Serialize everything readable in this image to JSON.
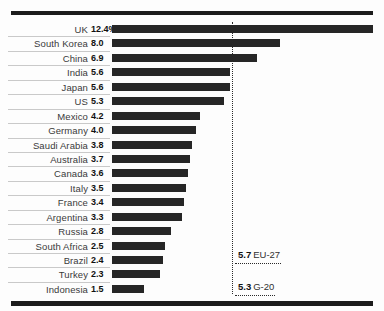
{
  "chart_data": {
    "type": "bar",
    "title": "",
    "subtitle": "",
    "xlabel": "",
    "ylabel": "",
    "orientation": "horizontal",
    "grid": false,
    "legend": "none",
    "value_suffix": "%",
    "xlim": [
      0,
      12.4
    ],
    "categories": [
      "UK",
      "South Korea",
      "China",
      "India",
      "Japan",
      "US",
      "Mexico",
      "Germany",
      "Saudi Arabia",
      "Australia",
      "Canada",
      "Italy",
      "France",
      "Argentina",
      "Russia",
      "South Africa",
      "Brazil",
      "Turkey",
      "Indonesia"
    ],
    "values": [
      12.4,
      8.0,
      6.9,
      5.6,
      5.6,
      5.3,
      4.2,
      4.0,
      3.8,
      3.7,
      3.6,
      3.5,
      3.4,
      3.3,
      2.8,
      2.5,
      2.4,
      2.3,
      1.5
    ],
    "value_labels": [
      "12.4%",
      "8.0",
      "6.9",
      "5.6",
      "5.6",
      "5.3",
      "4.2",
      "4.0",
      "3.8",
      "3.7",
      "3.6",
      "3.5",
      "3.4",
      "3.3",
      "2.8",
      "2.5",
      "2.4",
      "2.3",
      "1.5"
    ],
    "bar_color": "#262626",
    "reference_lines": [
      {
        "value": 5.7,
        "label": "EU-27",
        "value_text": "5.7"
      },
      {
        "value": 5.3,
        "label": "G-20",
        "value_text": "5.3"
      }
    ]
  },
  "rows": [
    {
      "label": "UK",
      "value_text": "12.4%"
    },
    {
      "label": "South Korea",
      "value_text": "8.0"
    },
    {
      "label": "China",
      "value_text": "6.9"
    },
    {
      "label": "India",
      "value_text": "5.6"
    },
    {
      "label": "Japan",
      "value_text": "5.6"
    },
    {
      "label": "US",
      "value_text": "5.3"
    },
    {
      "label": "Mexico",
      "value_text": "4.2"
    },
    {
      "label": "Germany",
      "value_text": "4.0"
    },
    {
      "label": "Saudi Arabia",
      "value_text": "3.8"
    },
    {
      "label": "Australia",
      "value_text": "3.7"
    },
    {
      "label": "Canada",
      "value_text": "3.6"
    },
    {
      "label": "Italy",
      "value_text": "3.5"
    },
    {
      "label": "France",
      "value_text": "3.4"
    },
    {
      "label": "Argentina",
      "value_text": "3.3"
    },
    {
      "label": "Russia",
      "value_text": "2.8"
    },
    {
      "label": "South Africa",
      "value_text": "2.5"
    },
    {
      "label": "Brazil",
      "value_text": "2.4"
    },
    {
      "label": "Turkey",
      "value_text": "2.3"
    },
    {
      "label": "Indonesia",
      "value_text": "1.5"
    }
  ],
  "annotations": {
    "eu": {
      "value_text": "5.7",
      "name": "EU-27"
    },
    "g20": {
      "value_text": "5.3",
      "name": "G-20"
    }
  }
}
